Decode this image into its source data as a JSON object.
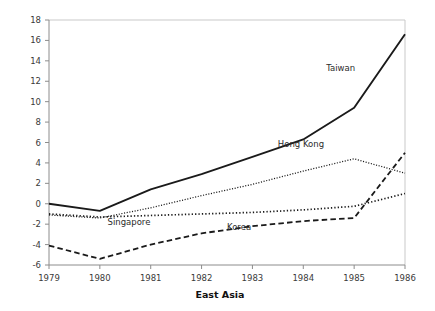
{
  "chart_data": {
    "type": "line",
    "title": "",
    "xlabel": "East Asia",
    "ylabel": "",
    "x": [
      1979,
      1980,
      1981,
      1982,
      1983,
      1984,
      1985,
      1986
    ],
    "categories": [
      "1979",
      "1980",
      "1981",
      "1982",
      "1983",
      "1984",
      "1985",
      "1986"
    ],
    "xlim": [
      1979,
      1986
    ],
    "ylim": [
      -6,
      18
    ],
    "ytick_labels": [
      "18",
      "16",
      "14",
      "12",
      "10",
      "8",
      "6",
      "4",
      "2",
      "0",
      "-2",
      "-4",
      "-6"
    ],
    "ytick_values": [
      18,
      16,
      14,
      12,
      10,
      8,
      6,
      4,
      2,
      0,
      -2,
      -4,
      -6
    ],
    "grid": false,
    "legend": "inline-labels",
    "series": [
      {
        "name": "Taiwan",
        "style": "solid",
        "color": "#1a1a1a",
        "values": [
          0.0,
          -0.7,
          1.4,
          2.9,
          4.6,
          6.3,
          9.4,
          16.6
        ],
        "label_x": 1984.45,
        "label_y": 13.0
      },
      {
        "name": "Hong Kong",
        "style": "fine-dotted",
        "color": "#1a1a1a",
        "values": [
          -1.1,
          -1.4,
          -0.4,
          0.8,
          1.9,
          3.2,
          4.4,
          3.0
        ],
        "label_x": 1983.5,
        "label_y": 5.6
      },
      {
        "name": "Singapore",
        "style": "bold-dotted",
        "color": "#1a1a1a",
        "values": [
          -1.0,
          -1.3,
          -1.15,
          -1.0,
          -0.85,
          -0.6,
          -0.25,
          1.0
        ],
        "label_x": 1980.15,
        "label_y": -2.05
      },
      {
        "name": "Korea",
        "style": "dashed",
        "color": "#1a1a1a",
        "values": [
          -4.1,
          -5.4,
          -4.0,
          -2.9,
          -2.2,
          -1.7,
          -1.4,
          5.0
        ],
        "label_x": 1982.5,
        "label_y": -2.6
      }
    ]
  }
}
